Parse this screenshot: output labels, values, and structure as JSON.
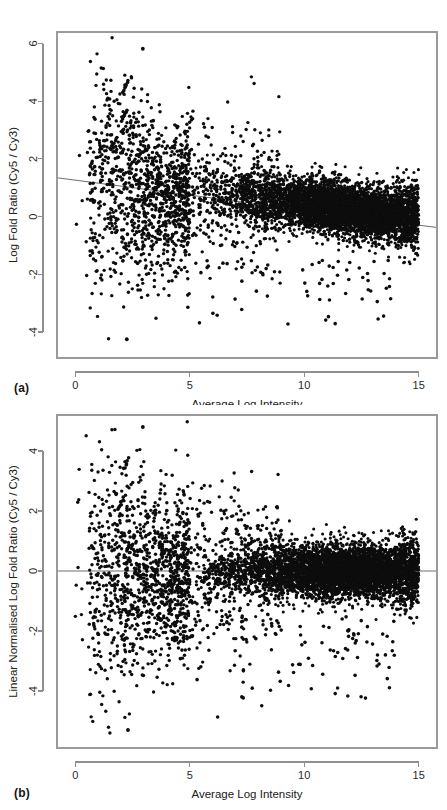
{
  "figure": {
    "panels": [
      {
        "tag": "(a)",
        "xlabel": "Average Log Intensity",
        "ylabel": "Log Fold Ratio (Cy5 / Cy3)",
        "xticks": [
          "0",
          "5",
          "10",
          "15"
        ],
        "yticks": [
          "6",
          "4",
          "2",
          "0",
          "-2",
          "-4"
        ]
      },
      {
        "tag": "(b)",
        "xlabel": "Average Log Intensity",
        "ylabel": "Linear Normalised Log Fold Ratio (Cy5 / Cy3)",
        "xticks": [
          "0",
          "5",
          "10",
          "15"
        ],
        "yticks": [
          "4",
          "2",
          "0",
          "-2",
          "-4"
        ]
      }
    ]
  },
  "colors": {
    "dot": "#0d0d0d",
    "axis": "#8e8e8e",
    "fit_line": "#6f6f6f",
    "background": "#ffffff",
    "text": "#202020"
  },
  "chart_data": [
    {
      "type": "scatter",
      "panel": "(a)",
      "title": "",
      "xlabel": "Average Log Intensity",
      "ylabel": "Log Fold Ratio (Cy5 / Cy3)",
      "xlim": [
        -0.8,
        15.8
      ],
      "ylim": [
        -4.9,
        6.4
      ],
      "xticks": [
        0,
        5,
        10,
        15
      ],
      "yticks": [
        6,
        4,
        2,
        0,
        -2,
        -4
      ],
      "grid": false,
      "legend": null,
      "n_points": 6800,
      "marker": "filled-circle",
      "marker_color": "#0d0d0d",
      "annotations": [
        {
          "kind": "trend-line",
          "label": "loess / linear fit",
          "color": "#6f6f6f",
          "x0": -0.8,
          "y0": 1.35,
          "x1": 15.8,
          "y1": -0.38
        }
      ],
      "description": "MA plot of raw (un-normalised) two-colour microarray data. Dense central cloud centred near log-ratio +0.4 for average log intensity 5-15, with a pronounced intensity-dependent downward trend. Sparse high-variance outliers at low intensity (x < 5) spanning -4.3 to +5.8, including several short diagonal streaks of saturated spots near x = 2-3.",
      "clusters": [
        {
          "name": "main-dense-cloud",
          "x_range": [
            5.0,
            15.0
          ],
          "y_center": 0.42,
          "y_spread": 0.45,
          "n": 5200,
          "x_peak": 11.5
        },
        {
          "name": "low-intensity-scatter",
          "x_range": [
            0.0,
            5.0
          ],
          "y_center": 0.25,
          "y_spread": 1.15,
          "n": 1150
        },
        {
          "name": "mid-intensity-scatter",
          "x_range": [
            4.5,
            9.0
          ],
          "y_center": 0.45,
          "y_spread": 0.95,
          "n": 380
        },
        {
          "name": "negative-outlier-tail",
          "x_range": [
            2.0,
            14.0
          ],
          "y_range": [
            -4.3,
            -1.5
          ],
          "n": 70
        }
      ],
      "streaks": [
        {
          "x0": 2.0,
          "y0": 3.35,
          "x1": 2.25,
          "y1": 3.7,
          "n": 7
        },
        {
          "x0": 2.05,
          "y0": 4.3,
          "x1": 2.3,
          "y1": 4.7,
          "n": 7
        },
        {
          "x0": 1.55,
          "y0": 2.35,
          "x1": 1.75,
          "y1": 2.6,
          "n": 4
        }
      ],
      "extremes": {
        "max_y": 5.82,
        "min_y": -4.25,
        "max_x": 15.0,
        "min_x": 0.0
      }
    },
    {
      "type": "scatter",
      "panel": "(b)",
      "title": "",
      "xlabel": "Average Log Intensity",
      "ylabel": "Linear Normalised Log Fold Ratio (Cy5 / Cy3)",
      "xlim": [
        -0.8,
        15.8
      ],
      "ylim": [
        -5.9,
        5.2
      ],
      "xticks": [
        0,
        5,
        10,
        15
      ],
      "yticks": [
        4,
        2,
        0,
        -2,
        -4
      ],
      "grid": false,
      "legend": null,
      "n_points": 6800,
      "marker": "filled-circle",
      "marker_color": "#0d0d0d",
      "annotations": [
        {
          "kind": "zero-line",
          "label": "y = 0 reference",
          "color": "#6f6f6f",
          "x0": -0.8,
          "y0": 0.0,
          "x1": 15.8,
          "y1": 0.0
        }
      ],
      "description": "Same MA plot after linear normalisation. The dense cloud is re-centred on zero across the whole intensity range, removing the intensity-dependent trend seen in panel (a). Low-intensity outliers remain, now spread roughly symmetrically from -5.3 to +4.8, with the same saturated-spot diagonal streaks near x = 2-3.",
      "clusters": [
        {
          "name": "main-dense-cloud",
          "x_range": [
            5.0,
            15.0
          ],
          "y_center": 0.0,
          "y_spread": 0.45,
          "n": 5200,
          "x_peak": 11.5
        },
        {
          "name": "low-intensity-scatter",
          "x_range": [
            0.0,
            5.0
          ],
          "y_center": -0.15,
          "y_spread": 1.25,
          "n": 1150
        },
        {
          "name": "mid-intensity-scatter",
          "x_range": [
            4.5,
            9.0
          ],
          "y_center": 0.0,
          "y_spread": 1.0,
          "n": 380
        },
        {
          "name": "negative-outlier-tail",
          "x_range": [
            2.0,
            14.0
          ],
          "y_range": [
            -5.3,
            -1.5
          ],
          "n": 90
        }
      ],
      "streaks": [
        {
          "x0": 1.85,
          "y0": 2.05,
          "x1": 2.1,
          "y1": 2.45,
          "n": 6
        },
        {
          "x0": 2.1,
          "y0": 3.4,
          "x1": 2.35,
          "y1": 3.75,
          "n": 6
        },
        {
          "x0": 2.6,
          "y0": 0.0,
          "x1": 3.3,
          "y1": -0.55,
          "n": 10
        }
      ],
      "extremes": {
        "max_y": 4.8,
        "min_y": -5.3,
        "max_x": 15.0,
        "min_x": 0.0
      }
    }
  ]
}
